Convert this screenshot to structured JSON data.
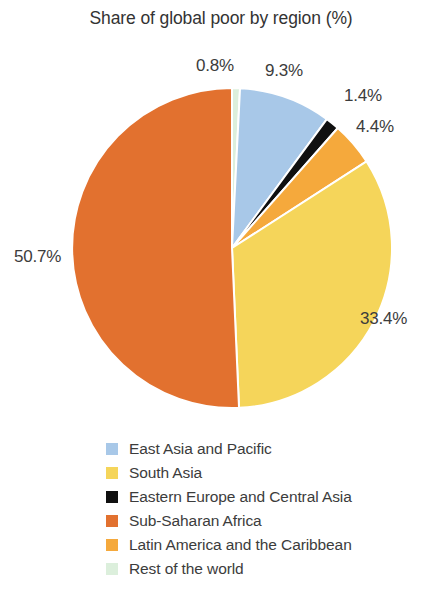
{
  "chart_data": {
    "type": "pie",
    "title": "Share of global poor by region (%)",
    "xlabel": "",
    "ylabel": "",
    "legend_position": "bottom-left",
    "grid": false,
    "value_suffix": "%",
    "categories": [
      "East Asia and Pacific",
      "South Asia",
      "Eastern Europe and Central Asia",
      "Sub-Saharan Africa",
      "Latin America and the Caribbean",
      "Rest of the world"
    ],
    "values": [
      9.3,
      33.4,
      1.4,
      50.7,
      4.4,
      0.8
    ],
    "value_labels": [
      "9.3%",
      "33.4%",
      "1.4%",
      "50.7%",
      "4.4%",
      "0.8%"
    ],
    "colors": [
      "#A8C8E8",
      "#F5D55A",
      "#101010",
      "#E2712F",
      "#F5A93C",
      "#DCEFDC"
    ],
    "slices": [
      {
        "name": "East Asia and Pacific",
        "value": 9.3,
        "label": "9.3%",
        "color": "#A8C8E8"
      },
      {
        "name": "South Asia",
        "value": 33.4,
        "label": "33.4%",
        "color": "#F5D55A"
      },
      {
        "name": "Eastern Europe and Central Asia",
        "value": 1.4,
        "label": "1.4%",
        "color": "#101010"
      },
      {
        "name": "Sub-Saharan Africa",
        "value": 50.7,
        "label": "50.7%",
        "color": "#E2712F"
      },
      {
        "name": "Latin America and the Caribbean",
        "value": 4.4,
        "label": "4.4%",
        "color": "#F5A93C"
      },
      {
        "name": "Rest of the world",
        "value": 0.8,
        "label": "0.8%",
        "color": "#DCEFDC"
      }
    ]
  },
  "chart": {
    "title": "Share of global poor by region (%)",
    "labels": {
      "rest_of_world": "0.8%",
      "east_asia": "9.3%",
      "eastern_europe": "1.4%",
      "latin_america": "4.4%",
      "south_asia": "33.4%",
      "sub_saharan": "50.7%"
    }
  },
  "legend": {
    "items": [
      {
        "label": "East Asia and Pacific",
        "color": "#A8C8E8",
        "swatch_name": "legend-swatch-east-asia-and-pacific"
      },
      {
        "label": "South Asia",
        "color": "#F5D55A",
        "swatch_name": "legend-swatch-south-asia"
      },
      {
        "label": "Eastern Europe and Central Asia",
        "color": "#101010",
        "swatch_name": "legend-swatch-eastern-europe-and-central-asia"
      },
      {
        "label": "Sub-Saharan Africa",
        "color": "#E2712F",
        "swatch_name": "legend-swatch-sub-saharan-africa"
      },
      {
        "label": "Latin America and the Caribbean",
        "color": "#F5A93C",
        "swatch_name": "legend-swatch-latin-america-and-the-caribbean"
      },
      {
        "label": "Rest of the world",
        "color": "#DCEFDC",
        "swatch_name": "legend-swatch-rest-of-the-world"
      }
    ]
  }
}
